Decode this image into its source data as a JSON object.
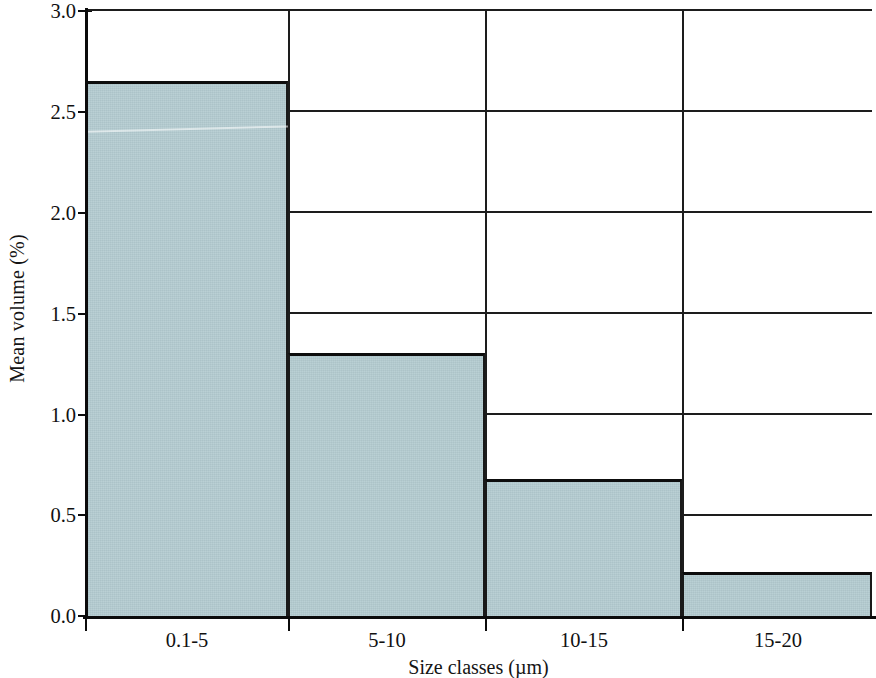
{
  "chart_data": {
    "type": "bar",
    "title": "",
    "subtitle": "",
    "xlabel": "Size classes (µm)",
    "ylabel": "Mean volume (%)",
    "categories": [
      "0.1-5",
      "5-10",
      "10-15",
      "15-20"
    ],
    "values": [
      2.65,
      1.3,
      0.68,
      0.22
    ],
    "series": [
      {
        "name": "Mean volume",
        "values": [
          2.65,
          1.3,
          0.68,
          0.22
        ]
      }
    ],
    "ylim": [
      0.0,
      3.0
    ],
    "y_ticks": [
      0.0,
      0.5,
      1.0,
      1.5,
      2.0,
      2.5,
      3.0
    ],
    "y_tick_labels": [
      "0.0",
      "0.5",
      "1.0",
      "1.5",
      "2.0",
      "2.5",
      "3.0"
    ],
    "grid": true,
    "grid_axis": "y",
    "legend": false,
    "legend_position": "none",
    "bar_gap": 0,
    "annotations": [],
    "colors": {
      "bar_fill": "#b3cbd0",
      "bar_edge": "#0d0d0d",
      "gridline": "#1d1d1d",
      "axis": "#0b0b0b",
      "text": "#111111",
      "background": "#ffffff"
    }
  }
}
